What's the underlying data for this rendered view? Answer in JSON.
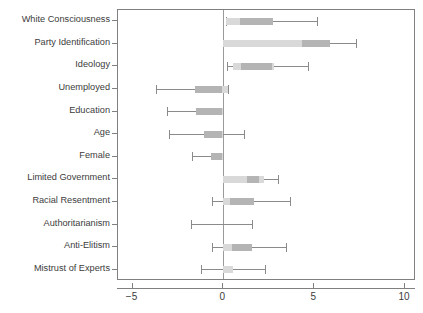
{
  "chart_data": {
    "type": "bar",
    "subtype": "coefficient-dot-whisker",
    "title": "",
    "subtitle": "",
    "xlabel": "",
    "ylabel": "",
    "xlim": [
      -5.8,
      10.6
    ],
    "ylim": [
      0,
      12
    ],
    "grid": false,
    "legend": false,
    "zero_reference_line": 0,
    "xticks": [
      -5,
      0,
      5,
      10
    ],
    "xticklabels": [
      "−5",
      "0",
      "5",
      "10"
    ],
    "categories": [
      "White Consciousness",
      "Party Identification",
      "Ideology",
      "Unemployed",
      "Education",
      "Age",
      "Female",
      "Limited Government",
      "Racial Resentment",
      "Authoritarianism",
      "Anti-Elitism",
      "Mistrust of Experts"
    ],
    "series": [
      {
        "name": "Inner interval (thick band)",
        "intervals": [
          [
            0.15,
            2.75
          ],
          [
            0.0,
            5.85
          ],
          [
            0.55,
            2.8
          ],
          [
            -1.55,
            0.25
          ],
          [
            -1.5,
            0.0
          ],
          [
            -1.05,
            0.0
          ],
          [
            -0.7,
            0.0
          ],
          [
            0.0,
            2.25
          ],
          [
            0.0,
            1.7
          ],
          [
            0.0,
            0.0
          ],
          [
            0.0,
            1.55
          ],
          [
            0.0,
            0.55
          ]
        ]
      },
      {
        "name": "Outer interval (whisker)",
        "intervals": [
          [
            0.15,
            5.15
          ],
          [
            0.0,
            7.3
          ],
          [
            0.2,
            4.65
          ],
          [
            -3.7,
            0.25
          ],
          [
            -3.1,
            0.0
          ],
          [
            -3.0,
            1.15
          ],
          [
            -1.75,
            0.0
          ],
          [
            0.0,
            3.0
          ],
          [
            -0.65,
            3.65
          ],
          [
            -1.8,
            1.6
          ],
          [
            -0.6,
            3.45
          ],
          [
            -1.25,
            2.3
          ]
        ]
      },
      {
        "name": "Dark segment (innermost)",
        "intervals": [
          [
            0.9,
            2.75
          ],
          [
            4.3,
            5.85
          ],
          [
            0.95,
            2.7
          ],
          [
            -1.55,
            -0.1
          ],
          [
            -1.5,
            -0.05
          ],
          [
            -1.05,
            -0.1
          ],
          [
            -0.7,
            -0.05
          ],
          [
            1.3,
            1.95
          ],
          [
            0.35,
            1.7
          ],
          [
            null,
            null
          ],
          [
            0.45,
            1.55
          ],
          [
            null,
            null
          ]
        ]
      }
    ]
  }
}
